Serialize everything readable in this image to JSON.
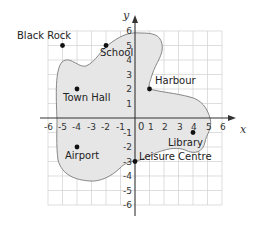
{
  "diagram": {
    "type": "coordinate-map",
    "axes": {
      "x_label": "x",
      "y_label": "y",
      "x_range": [
        -6,
        6
      ],
      "y_range": [
        -6,
        6
      ]
    },
    "x_ticks": [
      "-6",
      "-5",
      "-4",
      "-3",
      "-2",
      "-1",
      "0",
      "1",
      "2",
      "3",
      "4",
      "5",
      "6"
    ],
    "y_ticks": [
      "6",
      "5",
      "4",
      "3",
      "2",
      "1",
      "-1",
      "-2",
      "-3",
      "-4",
      "-5",
      "-6"
    ],
    "origin_label": "0",
    "island_fill": "#e6e6e6",
    "outline_color": "#7a7a7a",
    "locations": [
      {
        "name": "Black Rock",
        "x": -5,
        "y": 5
      },
      {
        "name": "School",
        "x": -2,
        "y": 5
      },
      {
        "name": "Town Hall",
        "x": -4,
        "y": 2
      },
      {
        "name": "Harbour",
        "x": 1,
        "y": 2
      },
      {
        "name": "Airport",
        "x": -4,
        "y": -2
      },
      {
        "name": "Leisure Centre",
        "x": 0,
        "y": -3
      },
      {
        "name": "Library",
        "x": 4,
        "y": -1
      }
    ]
  }
}
